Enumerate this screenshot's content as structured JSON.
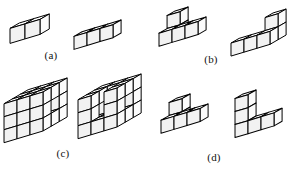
{
  "figure": {
    "background_color": "#ffffff",
    "line_color": "#000000",
    "face_colors": {
      "top": "#ffffff",
      "left": "#fbfbfb",
      "right": "#f2f2f2"
    },
    "projection": {
      "cube_size": 13,
      "dx": 1.0,
      "dy": 0.5
    },
    "panels": [
      {
        "id": "a",
        "label": "(a)",
        "label_left": 40,
        "label_top": 50,
        "label_width": 22,
        "panel_left": 0,
        "panel_top": 0,
        "panel_width": 151,
        "panel_height": 70,
        "shapes": [
          {
            "name": "shape-a-1",
            "description": "2 cubes in a row",
            "origin_x": 8,
            "origin_y": 12,
            "cube_size": 15,
            "cells": [
              [
                0,
                0,
                0
              ],
              [
                1,
                0,
                0
              ]
            ]
          },
          {
            "name": "shape-a-2",
            "description": "3 cubes in a row",
            "origin_x": 72,
            "origin_y": 18,
            "cube_size": 13,
            "cells": [
              [
                0,
                0,
                0
              ],
              [
                1,
                0,
                0
              ],
              [
                2,
                0,
                0
              ]
            ]
          }
        ]
      },
      {
        "id": "b",
        "label": "(b)",
        "label_left": 200,
        "label_top": 54,
        "label_width": 22,
        "panel_left": 151,
        "panel_top": 0,
        "panel_width": 151,
        "panel_height": 70,
        "shapes": [
          {
            "name": "shape-b-1",
            "description": "L shape, three in a row with two stacked at back left",
            "origin_x": 6,
            "origin_y": 5,
            "cube_size": 13,
            "cells": [
              [
                0,
                0,
                0
              ],
              [
                1,
                0,
                0
              ],
              [
                2,
                0,
                0
              ],
              [
                0,
                1,
                0
              ],
              [
                0,
                1,
                1
              ]
            ]
          },
          {
            "name": "shape-b-2",
            "description": "mirrored L shape, three in a row with two stacked at right",
            "origin_x": 78,
            "origin_y": 7,
            "cube_size": 13,
            "cells": [
              [
                0,
                0,
                0
              ],
              [
                1,
                0,
                0
              ],
              [
                2,
                0,
                0
              ],
              [
                2,
                1,
                0
              ],
              [
                2,
                1,
                1
              ]
            ]
          }
        ]
      },
      {
        "id": "c",
        "label": "(c)",
        "label_left": 52,
        "label_top": 148,
        "label_width": 22,
        "panel_left": 0,
        "panel_top": 70,
        "panel_width": 151,
        "panel_height": 110,
        "shapes": [
          {
            "name": "shape-c-1",
            "description": "large 3x3x3 style block with a notch",
            "origin_x": 2,
            "origin_y": 6,
            "cube_size": 13,
            "cells": [
              [
                0,
                0,
                0
              ],
              [
                1,
                0,
                0
              ],
              [
                2,
                0,
                0
              ],
              [
                0,
                0,
                1
              ],
              [
                1,
                0,
                1
              ],
              [
                2,
                0,
                1
              ],
              [
                0,
                0,
                2
              ],
              [
                1,
                0,
                2
              ],
              [
                2,
                0,
                2
              ],
              [
                0,
                1,
                0
              ],
              [
                1,
                1,
                0
              ],
              [
                2,
                1,
                0
              ],
              [
                0,
                1,
                2
              ],
              [
                1,
                1,
                2
              ],
              [
                2,
                1,
                2
              ],
              [
                0,
                2,
                0
              ],
              [
                1,
                2,
                0
              ],
              [
                2,
                2,
                0
              ],
              [
                0,
                2,
                1
              ],
              [
                1,
                2,
                1
              ],
              [
                2,
                2,
                1
              ],
              [
                0,
                2,
                2
              ],
              [
                1,
                2,
                2
              ],
              [
                2,
                2,
                2
              ]
            ]
          },
          {
            "name": "shape-c-2",
            "description": "large block rotated with vertical slot",
            "origin_x": 76,
            "origin_y": 2,
            "cube_size": 13,
            "cells": [
              [
                0,
                0,
                0
              ],
              [
                1,
                0,
                0
              ],
              [
                2,
                0,
                0
              ],
              [
                0,
                1,
                0
              ],
              [
                1,
                1,
                0
              ],
              [
                2,
                1,
                0
              ],
              [
                0,
                2,
                0
              ],
              [
                1,
                2,
                0
              ],
              [
                2,
                2,
                0
              ],
              [
                0,
                0,
                1
              ],
              [
                2,
                0,
                1
              ],
              [
                0,
                2,
                1
              ],
              [
                1,
                2,
                1
              ],
              [
                2,
                2,
                1
              ],
              [
                0,
                0,
                2
              ],
              [
                2,
                0,
                2
              ],
              [
                0,
                2,
                2
              ],
              [
                1,
                2,
                2
              ],
              [
                2,
                2,
                2
              ],
              [
                0,
                1,
                2
              ],
              [
                2,
                1,
                2
              ]
            ]
          }
        ]
      },
      {
        "id": "d",
        "label": "(d)",
        "label_left": 203,
        "label_top": 152,
        "label_width": 22,
        "panel_left": 151,
        "panel_top": 70,
        "panel_width": 151,
        "panel_height": 110,
        "shapes": [
          {
            "name": "shape-d-1",
            "description": "L shape with two cubes stacked at back left",
            "origin_x": 8,
            "origin_y": 22,
            "cube_size": 13,
            "cells": [
              [
                0,
                0,
                0
              ],
              [
                1,
                0,
                0
              ],
              [
                2,
                0,
                0
              ],
              [
                0,
                1,
                0
              ],
              [
                0,
                1,
                1
              ]
            ]
          },
          {
            "name": "shape-d-2",
            "description": "L shape with vertical stack of three at left",
            "origin_x": 82,
            "origin_y": 18,
            "cube_size": 13,
            "cells": [
              [
                0,
                0,
                0
              ],
              [
                1,
                0,
                0
              ],
              [
                2,
                0,
                0
              ],
              [
                0,
                0,
                1
              ],
              [
                0,
                0,
                2
              ]
            ]
          }
        ]
      }
    ]
  }
}
